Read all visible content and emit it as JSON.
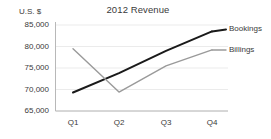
{
  "chart_data": {
    "type": "line",
    "title": "2012 Revenue",
    "xlabel": "",
    "ylabel": "U.S. $",
    "categories": [
      "Q1",
      "Q2",
      "Q3",
      "Q4"
    ],
    "ylim": [
      65000,
      85000
    ],
    "yticks": [
      "65,000",
      "70,000",
      "75,000",
      "80,000",
      "85,000"
    ],
    "ytick_values": [
      65000,
      70000,
      75000,
      80000,
      85000
    ],
    "grid": true,
    "legend_position": "right-inline",
    "series": [
      {
        "name": "Bookings",
        "values": [
          69300,
          73800,
          79000,
          83500
        ],
        "color": "#1a1a1a",
        "width": 2.0
      },
      {
        "name": "Billings",
        "values": [
          79500,
          69400,
          75500,
          79200
        ],
        "color": "#9a9a9a",
        "width": 1.4
      }
    ],
    "axis_color": "#b8b8b8",
    "grid_color": "#e2e2e2",
    "text_color": "#3a3a3a",
    "background": "#ffffff"
  }
}
